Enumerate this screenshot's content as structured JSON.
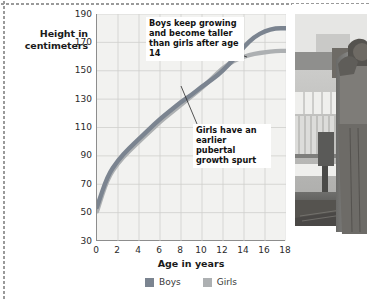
{
  "figure": {
    "legend": [
      {
        "label": "Boys",
        "color": "#7b8490",
        "icon": "legend-swatch"
      },
      {
        "label": "Girls",
        "color": "#adb0b2",
        "icon": "legend-swatch"
      }
    ],
    "photo": {
      "alt": "black-and-white photograph of a teenager standing in a classroom",
      "icon": "photo-thumbnail"
    }
  },
  "chart_data": {
    "type": "line",
    "title": "",
    "xlabel": "Age in years",
    "ylabel": "Height in centimeters",
    "xlim": [
      0,
      18
    ],
    "ylim": [
      30,
      190
    ],
    "xticks": [
      0,
      2,
      4,
      6,
      8,
      10,
      12,
      14,
      16,
      18
    ],
    "yticks": [
      30,
      50,
      70,
      90,
      110,
      130,
      150,
      170,
      190
    ],
    "grid": true,
    "legend_position": "bottom-center",
    "x": [
      0,
      1,
      2,
      3,
      4,
      5,
      6,
      7,
      8,
      9,
      10,
      11,
      12,
      13,
      14,
      15,
      16,
      17,
      18
    ],
    "series": [
      {
        "name": "Boys",
        "color": "#7b8490",
        "values": [
          54,
          76,
          87,
          95,
          102,
          109,
          116,
          122,
          128,
          133,
          139,
          144,
          150,
          158,
          167,
          174,
          178,
          180,
          180
        ]
      },
      {
        "name": "Girls",
        "color": "#adb0b2",
        "values": [
          51,
          74,
          85,
          93,
          100,
          107,
          114,
          120,
          126,
          132,
          138,
          145,
          152,
          157,
          160,
          162,
          163,
          164,
          164
        ]
      }
    ],
    "annotations": [
      {
        "name": "boys-annotation",
        "text": "Boys keep growing and become taller than girls after age 14",
        "points_to_series": "Boys",
        "points_to_x": 16
      },
      {
        "name": "girls-annotation",
        "text": "Girls have an earlier pubertal growth spurt",
        "points_to_series": "Girls",
        "points_to_x": 12
      }
    ]
  }
}
